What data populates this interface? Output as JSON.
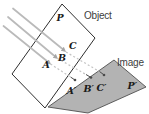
{
  "figure": {
    "caption_labels": {
      "object_plane": "Object",
      "image_plane": "Image"
    },
    "point_labels": {
      "p": "P",
      "c": "C",
      "b": "B",
      "a": "A",
      "a_prime": "A′",
      "b_prime": "B′",
      "c_prime": "C′",
      "p_prime": "P′"
    },
    "colors": {
      "background": "#ffffff",
      "object_plane_fill": "#ffffff",
      "object_plane_outline": "#2e2e2e",
      "image_plane_fill": "#b3b3b3",
      "image_plane_outline": "#4f4f4f",
      "ray": "#bababa",
      "arrowhead": "#a6a6a6",
      "projection_dash": "#c4c4c4",
      "projection_solid": "#4a4a4a",
      "point_dot": "#4a4a4a"
    }
  }
}
